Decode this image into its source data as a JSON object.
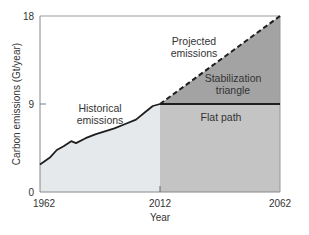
{
  "chart_data": {
    "type": "area",
    "title": "",
    "xlabel": "Year",
    "ylabel": "Carbon emissions (Gt/year)",
    "xlim": [
      1962,
      2062
    ],
    "ylim": [
      0,
      18
    ],
    "x_ticks": [
      "1962",
      "2012",
      "2062"
    ],
    "y_ticks": [
      "0",
      "9",
      "18"
    ],
    "grid": false,
    "legend": null,
    "series": [
      {
        "name": "Historical emissions",
        "style": "solid",
        "x": [
          1962,
          1966,
          1969,
          1972,
          1975,
          1977,
          1981,
          1985,
          1989,
          1993,
          1997,
          2002,
          2006,
          2009,
          2012
        ],
        "values": [
          2.8,
          3.5,
          4.3,
          4.7,
          5.2,
          5.0,
          5.5,
          5.9,
          6.2,
          6.5,
          6.9,
          7.4,
          8.2,
          8.8,
          9.0
        ]
      },
      {
        "name": "Projected emissions",
        "style": "dashed",
        "x": [
          2012,
          2062
        ],
        "values": [
          9,
          18
        ]
      },
      {
        "name": "Flat path",
        "style": "solid",
        "x": [
          2012,
          2062
        ],
        "values": [
          9,
          9
        ]
      }
    ],
    "regions": [
      {
        "name": "Historical emissions",
        "x": [
          1962,
          2012
        ],
        "fill": "#e6e9ec"
      },
      {
        "name": "Flat path",
        "x": [
          2012,
          2062
        ],
        "y": [
          0,
          9
        ],
        "fill": "#c4c4c4"
      },
      {
        "name": "Stabilization triangle",
        "x": [
          2012,
          2062
        ],
        "y_between": [
          "Flat path",
          "Projected emissions"
        ],
        "fill": "#a3a3a3"
      }
    ],
    "annotations": [
      "Historical emissions",
      "Projected emissions",
      "Stabilization triangle",
      "Flat path"
    ]
  },
  "labels": {
    "y_top": "18",
    "y_mid": "9",
    "y_bottom": "0",
    "x_start": "1962",
    "x_mid": "2012",
    "x_end": "2062",
    "x_title": "Year",
    "y_title": "Carbon emissions (Gt/year)",
    "historical_1": "Historical",
    "historical_2": "emissions",
    "projected_1": "Projected",
    "projected_2": "emissions",
    "triangle_1": "Stabilization",
    "triangle_2": "triangle",
    "flat": "Flat path"
  },
  "colors": {
    "historical_fill": "#e6e9ec",
    "flat_fill": "#c4c4c4",
    "triangle_fill": "#a3a3a3",
    "line": "#1e1e1e",
    "axis": "#888888"
  }
}
